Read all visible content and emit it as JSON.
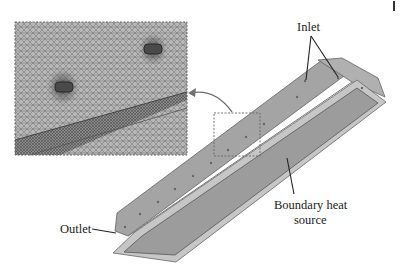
{
  "figure": {
    "labels": {
      "inlet": "Inlet",
      "outlet": "Outlet",
      "heat_source_line1": "Boundary heat",
      "heat_source_line2": "source"
    },
    "inset": {
      "description": "Zoomed mesh view of inlet holes",
      "border_style": "dotted"
    },
    "colors": {
      "body_fill": "#a9a9a9",
      "plate_fill": "#9a9a9a",
      "rim": "#c8c8c8",
      "mesh_bg": "#b4b4b4",
      "line": "#222222",
      "arrow": "#707070"
    }
  }
}
